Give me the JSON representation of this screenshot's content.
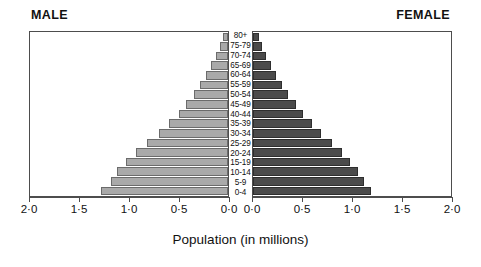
{
  "header": {
    "male_label": "MALE",
    "female_label": "FEMALE"
  },
  "axis_title": "Population (in millions)",
  "tick_labels_male": [
    "2·0",
    "1·5",
    "1·0",
    "0·5",
    "0·0"
  ],
  "tick_labels_female": [
    "0·0",
    "0·5",
    "1·0",
    "1·5",
    "2·0"
  ],
  "colors": {
    "male_bar": "#a9a9a9",
    "female_bar": "#4b4b4b",
    "frame": "#4d4d4d",
    "text": "#111111",
    "background": "#ffffff"
  },
  "chart_data": {
    "type": "bar",
    "subtype": "population-pyramid",
    "title": "",
    "xlabel": "Population (in millions)",
    "ylabel": "",
    "xlim": [
      0,
      2.0
    ],
    "xticks": [
      0.0,
      0.5,
      1.0,
      1.5,
      2.0
    ],
    "grid": false,
    "legend": "panel-headers",
    "categories": [
      "80+",
      "75-79",
      "70-74",
      "65-69",
      "60-64",
      "55-59",
      "50-54",
      "45-49",
      "40-44",
      "35-39",
      "30-34",
      "25-29",
      "20-24",
      "15-19",
      "10-14",
      "5-9",
      "0-4"
    ],
    "series": [
      {
        "name": "MALE",
        "side": "left",
        "color": "#a9a9a9",
        "values": [
          0.05,
          0.08,
          0.12,
          0.17,
          0.22,
          0.28,
          0.34,
          0.42,
          0.5,
          0.6,
          0.7,
          0.82,
          0.93,
          1.03,
          1.12,
          1.18,
          1.28
        ]
      },
      {
        "name": "FEMALE",
        "side": "right",
        "color": "#4b4b4b",
        "values": [
          0.06,
          0.09,
          0.13,
          0.18,
          0.23,
          0.29,
          0.35,
          0.43,
          0.51,
          0.6,
          0.69,
          0.8,
          0.9,
          0.98,
          1.06,
          1.12,
          1.19
        ]
      }
    ]
  }
}
